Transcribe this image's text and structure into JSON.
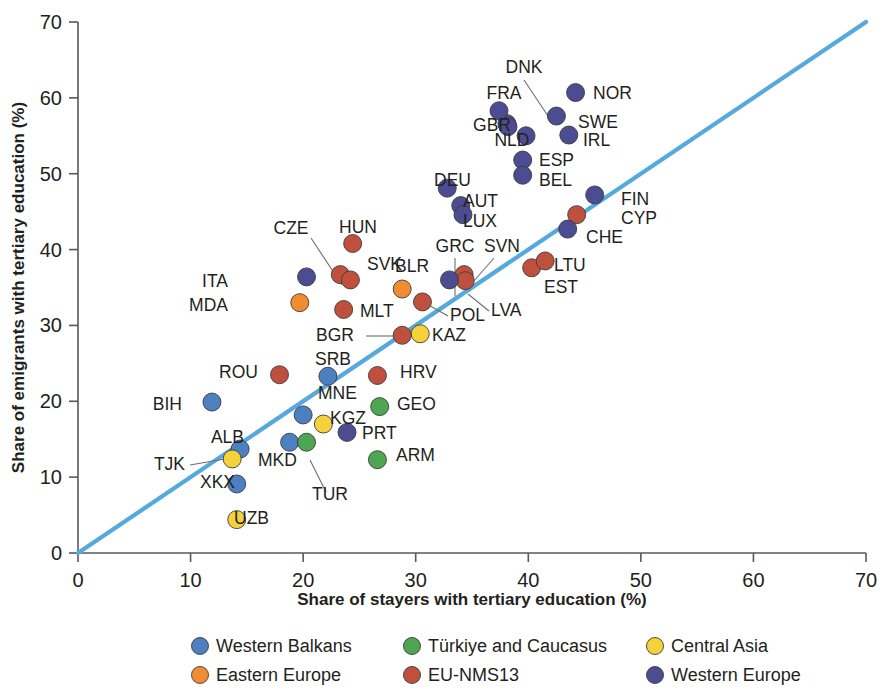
{
  "chart_data": {
    "type": "scatter",
    "title": "",
    "xlabel": "Share of stayers with tertiary education (%)",
    "ylabel": "Share of emigrants with tertiary education (%)",
    "xlim": [
      0,
      70
    ],
    "ylim": [
      0,
      70
    ],
    "xticks": [
      0,
      10,
      20,
      30,
      40,
      50,
      60,
      70
    ],
    "yticks": [
      0,
      10,
      20,
      30,
      40,
      50,
      60,
      70
    ],
    "grid": false,
    "legend_position": "bottom",
    "reference_line": {
      "name": "45-degree parity line",
      "from": [
        0,
        0
      ],
      "to": [
        70,
        70
      ],
      "color": "#56a9dd"
    },
    "series": [
      {
        "name": "Western Balkans",
        "color": "#4c80c0",
        "points": [
          {
            "code": "BIH",
            "x": 11.9,
            "y": 19.9
          },
          {
            "code": "SRB",
            "x": 22.2,
            "y": 23.3
          },
          {
            "code": "MNE",
            "x": 20.0,
            "y": 18.2
          },
          {
            "code": "MKD",
            "x": 18.8,
            "y": 14.6
          },
          {
            "code": "ALB",
            "x": 14.4,
            "y": 13.7
          },
          {
            "code": "XKX",
            "x": 14.1,
            "y": 9.1
          }
        ]
      },
      {
        "name": "Türkiye and Caucasus",
        "color": "#4ea652",
        "points": [
          {
            "code": "GEO",
            "x": 26.8,
            "y": 19.3
          },
          {
            "code": "ARM",
            "x": 26.6,
            "y": 12.3
          },
          {
            "code": "TUR",
            "x": 20.3,
            "y": 14.6
          }
        ]
      },
      {
        "name": "Central Asia",
        "color": "#f5d23c",
        "points": [
          {
            "code": "KAZ",
            "x": 30.4,
            "y": 28.9
          },
          {
            "code": "KGZ",
            "x": 21.8,
            "y": 17.0
          },
          {
            "code": "TJK",
            "x": 13.7,
            "y": 12.4
          },
          {
            "code": "UZB",
            "x": 14.1,
            "y": 4.4
          }
        ]
      },
      {
        "name": "Eastern Europe",
        "color": "#f08c32",
        "points": [
          {
            "code": "MDA",
            "x": 19.7,
            "y": 33.0
          },
          {
            "code": "BLR",
            "x": 28.8,
            "y": 34.8
          }
        ]
      },
      {
        "name": "EU-NMS13",
        "color": "#c0503e",
        "points": [
          {
            "code": "HUN",
            "x": 24.4,
            "y": 40.8
          },
          {
            "code": "CZE",
            "x": 23.3,
            "y": 36.7
          },
          {
            "code": "SVK",
            "x": 24.2,
            "y": 36.0
          },
          {
            "code": "MLT",
            "x": 23.6,
            "y": 32.1
          },
          {
            "code": "POL",
            "x": 30.6,
            "y": 33.1
          },
          {
            "code": "BGR",
            "x": 28.8,
            "y": 28.7
          },
          {
            "code": "HRV",
            "x": 26.6,
            "y": 23.4
          },
          {
            "code": "ROU",
            "x": 17.9,
            "y": 23.5
          },
          {
            "code": "SVN",
            "x": 34.3,
            "y": 36.7
          },
          {
            "code": "LVA",
            "x": 34.4,
            "y": 35.9
          },
          {
            "code": "EST",
            "x": 40.3,
            "y": 37.6
          },
          {
            "code": "LTU",
            "x": 41.5,
            "y": 38.5
          },
          {
            "code": "CYP",
            "x": 44.3,
            "y": 44.6
          }
        ]
      },
      {
        "name": "Western Europe",
        "color": "#4c4c92",
        "points": [
          {
            "code": "DNK",
            "x": 38.1,
            "y": 56.6
          },
          {
            "code": "FRA",
            "x": 37.4,
            "y": 58.3
          },
          {
            "code": "GBR",
            "x": 38.2,
            "y": 56.2
          },
          {
            "code": "NOR",
            "x": 44.2,
            "y": 60.7
          },
          {
            "code": "SWE",
            "x": 42.5,
            "y": 57.6
          },
          {
            "code": "IRL",
            "x": 43.6,
            "y": 55.1
          },
          {
            "code": "NLD",
            "x": 39.8,
            "y": 55.0
          },
          {
            "code": "ESP",
            "x": 39.5,
            "y": 51.8
          },
          {
            "code": "BEL",
            "x": 39.5,
            "y": 49.8
          },
          {
            "code": "DEU",
            "x": 32.8,
            "y": 48.1
          },
          {
            "code": "AUT",
            "x": 34.0,
            "y": 45.8
          },
          {
            "code": "LUX",
            "x": 34.2,
            "y": 44.6
          },
          {
            "code": "FIN",
            "x": 45.9,
            "y": 47.2
          },
          {
            "code": "CHE",
            "x": 43.5,
            "y": 42.7
          },
          {
            "code": "GRC",
            "x": 33.0,
            "y": 36.0
          },
          {
            "code": "ITA",
            "x": 20.3,
            "y": 36.4
          },
          {
            "code": "PRT",
            "x": 23.9,
            "y": 15.9
          }
        ]
      }
    ],
    "legend": [
      {
        "label": "Western Balkans",
        "color": "#4c80c0"
      },
      {
        "label": "Türkiye and Caucasus",
        "color": "#4ea652"
      },
      {
        "label": "Central Asia",
        "color": "#f5d23c"
      },
      {
        "label": "Eastern Europe",
        "color": "#f08c32"
      },
      {
        "label": "EU-NMS13",
        "color": "#c0503e"
      },
      {
        "label": "Western Europe",
        "color": "#4c4c92"
      }
    ],
    "point_labels": [
      {
        "code": "DNK",
        "text": "DNK",
        "lx": 524,
        "ly": 73,
        "anchor": "middle",
        "leader": [
          [
            524,
            80
          ],
          [
            552,
            122
          ]
        ]
      },
      {
        "code": "FRA",
        "text": "FRA",
        "lx": 504,
        "ly": 99,
        "anchor": "middle"
      },
      {
        "code": "NOR",
        "text": "NOR",
        "lx": 593,
        "ly": 99,
        "anchor": "start"
      },
      {
        "code": "GBR",
        "text": "GBR",
        "lx": 492,
        "ly": 131,
        "anchor": "middle"
      },
      {
        "code": "SWE",
        "text": "SWE",
        "lx": 578,
        "ly": 128,
        "anchor": "start"
      },
      {
        "code": "NLD",
        "text": "NLD",
        "lx": 512,
        "ly": 146,
        "anchor": "middle"
      },
      {
        "code": "IRL",
        "text": "IRL",
        "lx": 583,
        "ly": 146,
        "anchor": "start"
      },
      {
        "code": "ESP",
        "text": "ESP",
        "lx": 539,
        "ly": 166,
        "anchor": "start"
      },
      {
        "code": "BEL",
        "text": "BEL",
        "lx": 539,
        "ly": 186,
        "anchor": "start"
      },
      {
        "code": "DEU",
        "text": "DEU",
        "lx": 434,
        "ly": 186,
        "anchor": "start"
      },
      {
        "code": "AUT",
        "text": "AUT",
        "lx": 463,
        "ly": 207,
        "anchor": "start"
      },
      {
        "code": "LUX",
        "text": "LUX",
        "lx": 463,
        "ly": 227,
        "anchor": "start"
      },
      {
        "code": "FIN",
        "text": "FIN",
        "lx": 621,
        "ly": 205,
        "anchor": "start"
      },
      {
        "code": "CYP",
        "text": "CYP",
        "lx": 621,
        "ly": 224,
        "anchor": "start"
      },
      {
        "code": "CHE",
        "text": "CHE",
        "lx": 586,
        "ly": 243,
        "anchor": "start"
      },
      {
        "code": "HUN",
        "text": "HUN",
        "lx": 358,
        "ly": 233,
        "anchor": "middle"
      },
      {
        "code": "CZE",
        "text": "CZE",
        "lx": 291,
        "ly": 234,
        "anchor": "middle",
        "leader": [
          [
            311,
            238
          ],
          [
            342,
            285
          ]
        ]
      },
      {
        "code": "SVK",
        "text": "SVK",
        "lx": 367,
        "ly": 270,
        "anchor": "start"
      },
      {
        "code": "BLR",
        "text": "BLR",
        "lx": 395,
        "ly": 272,
        "anchor": "start"
      },
      {
        "code": "GRC",
        "text": "GRC",
        "lx": 455,
        "ly": 252,
        "anchor": "middle",
        "leader": [
          [
            455,
            258
          ],
          [
            455,
            296
          ]
        ]
      },
      {
        "code": "SVN",
        "text": "SVN",
        "lx": 502,
        "ly": 252,
        "anchor": "middle",
        "leader": [
          [
            494,
            258
          ],
          [
            466,
            290
          ]
        ]
      },
      {
        "code": "LTU",
        "text": "LTU",
        "lx": 554,
        "ly": 271,
        "anchor": "start"
      },
      {
        "code": "ITA",
        "text": "ITA",
        "lx": 228,
        "ly": 287,
        "anchor": "end"
      },
      {
        "code": "MDA",
        "text": "MDA",
        "lx": 228,
        "ly": 311,
        "anchor": "end"
      },
      {
        "code": "MLT",
        "text": "MLT",
        "lx": 360,
        "ly": 317,
        "anchor": "start"
      },
      {
        "code": "POL",
        "text": "POL",
        "lx": 450,
        "ly": 321,
        "anchor": "start",
        "leader": [
          [
            448,
            316
          ],
          [
            425,
            303
          ]
        ]
      },
      {
        "code": "EST",
        "text": "EST",
        "lx": 544,
        "ly": 293,
        "anchor": "start"
      },
      {
        "code": "LVA",
        "text": "LVA",
        "lx": 491,
        "ly": 316,
        "anchor": "start",
        "leader": [
          [
            489,
            311
          ],
          [
            468,
            294
          ]
        ]
      },
      {
        "code": "BGR",
        "text": "BGR",
        "lx": 316,
        "ly": 341,
        "anchor": "start",
        "leader": [
          [
            366,
            336
          ],
          [
            396,
            336
          ]
        ]
      },
      {
        "code": "KAZ",
        "text": "KAZ",
        "lx": 432,
        "ly": 341,
        "anchor": "start"
      },
      {
        "code": "SRB",
        "text": "SRB",
        "lx": 333,
        "ly": 365,
        "anchor": "middle"
      },
      {
        "code": "ROU",
        "text": "ROU",
        "lx": 258,
        "ly": 378,
        "anchor": "end"
      },
      {
        "code": "HRV",
        "text": "HRV",
        "lx": 400,
        "ly": 378,
        "anchor": "start"
      },
      {
        "code": "BIH",
        "text": "BIH",
        "lx": 182,
        "ly": 410,
        "anchor": "end"
      },
      {
        "code": "MNE",
        "text": "MNE",
        "lx": 318,
        "ly": 399,
        "anchor": "start"
      },
      {
        "code": "GEO",
        "text": "GEO",
        "lx": 397,
        "ly": 410,
        "anchor": "start"
      },
      {
        "code": "KGZ",
        "text": "KGZ",
        "lx": 330,
        "ly": 424,
        "anchor": "start"
      },
      {
        "code": "PRT",
        "text": "PRT",
        "lx": 362,
        "ly": 439,
        "anchor": "start"
      },
      {
        "code": "ALB",
        "text": "ALB",
        "lx": 244,
        "ly": 443,
        "anchor": "end"
      },
      {
        "code": "TJK",
        "text": "TJK",
        "lx": 185,
        "ly": 470,
        "anchor": "end",
        "leader": [
          [
            190,
            465
          ],
          [
            242,
            456
          ]
        ]
      },
      {
        "code": "MKD",
        "text": "MKD",
        "lx": 258,
        "ly": 466,
        "anchor": "start"
      },
      {
        "code": "ARM",
        "text": "ARM",
        "lx": 396,
        "ly": 461,
        "anchor": "start"
      },
      {
        "code": "XKX",
        "text": "XKX",
        "lx": 235,
        "ly": 488,
        "anchor": "end"
      },
      {
        "code": "TUR",
        "text": "TUR",
        "lx": 312,
        "ly": 500,
        "anchor": "start",
        "leader": [
          [
            326,
            492
          ],
          [
            310,
            460
          ]
        ]
      },
      {
        "code": "UZB",
        "text": "UZB",
        "lx": 234,
        "ly": 524,
        "anchor": "start"
      }
    ]
  }
}
